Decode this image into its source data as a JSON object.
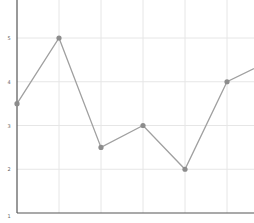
{
  "chart_data": {
    "type": "line",
    "title": "",
    "xlabel": "",
    "ylabel": "",
    "x": [
      0,
      1,
      2,
      3,
      4,
      5
    ],
    "series": [
      {
        "name": "series-1",
        "values": [
          3.5,
          5,
          2.5,
          3,
          2,
          4
        ],
        "continues_right_to": 4.3
      }
    ],
    "y_ticks": [
      "5",
      "4",
      "3",
      "2",
      "1"
    ],
    "y_tick_values": [
      5,
      4,
      3,
      2,
      1
    ],
    "ylim": [
      1,
      5.87
    ],
    "grid": true,
    "legend": "none",
    "colors": {
      "line": "#a0a0a0",
      "marker": "#8c8c8c",
      "grid": "#e6e6e6",
      "axis": "#555555",
      "tick_label": "#666666"
    }
  }
}
